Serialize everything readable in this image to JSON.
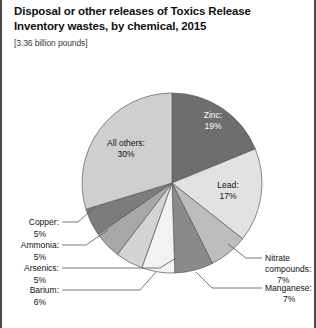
{
  "header": {
    "title": "Disposal or other releases of Toxics Release Inventory wastes, by chemical, 2015",
    "subtitle": "[3.36 billion pounds]"
  },
  "chart_data": {
    "type": "pie",
    "title": "Disposal or other releases of Toxics Release Inventory wastes, by chemical, 2015",
    "subtitle": "[3.36 billion pounds]",
    "unit": "percent of 3.36 billion pounds",
    "total_label": "3.36 billion pounds",
    "legend": "none",
    "grid": false,
    "categories": [
      "Zinc",
      "Lead",
      "Nitrate compounds",
      "Manganese",
      "Barium",
      "Arsenics",
      "Ammonia",
      "Copper",
      "All others"
    ],
    "values": [
      19,
      17,
      7,
      7,
      6,
      5,
      5,
      5,
      30
    ],
    "slices": [
      {
        "name": "Zinc",
        "label": "Zinc:",
        "value_label": "19%",
        "value": 19,
        "color": "#6e6e6e",
        "label_placement": "inside",
        "text_color": "#ffffff"
      },
      {
        "name": "Lead",
        "label": "Lead:",
        "value_label": "17%",
        "value": 17,
        "color": "#e2e2e2",
        "label_placement": "inside",
        "text_color": "#111111"
      },
      {
        "name": "Nitrate compounds",
        "label": "Nitrate compounds:",
        "value_label": "7%",
        "value": 7,
        "color": "#bdbdbd",
        "label_placement": "outside-right",
        "text_color": "#111111"
      },
      {
        "name": "Manganese",
        "label": "Manganese:",
        "value_label": "7%",
        "value": 7,
        "color": "#8a8a8a",
        "label_placement": "outside-right",
        "text_color": "#111111"
      },
      {
        "name": "Barium",
        "label": "Barium:",
        "value_label": "6%",
        "value": 6,
        "color": "#f2f2f2",
        "label_placement": "outside-left",
        "text_color": "#111111"
      },
      {
        "name": "Arsenics",
        "label": "Arsenics:",
        "value_label": "5%",
        "value": 5,
        "color": "#d4d4d4",
        "label_placement": "outside-left",
        "text_color": "#111111"
      },
      {
        "name": "Ammonia",
        "label": "Ammonia:",
        "value_label": "5%",
        "value": 5,
        "color": "#a8a8a8",
        "label_placement": "outside-left",
        "text_color": "#111111"
      },
      {
        "name": "Copper",
        "label": "Copper:",
        "value_label": "5%",
        "value": 5,
        "color": "#7c7c7c",
        "label_placement": "outside-left",
        "text_color": "#111111"
      },
      {
        "name": "All others",
        "label": "All others:",
        "value_label": "30%",
        "value": 30,
        "color": "#cfcfcf",
        "label_placement": "inside",
        "text_color": "#111111"
      }
    ]
  },
  "labels": {
    "zinc_name": "Zinc:",
    "zinc_pct": "19%",
    "lead_name": "Lead:",
    "lead_pct": "17%",
    "allothers_name": "All others:",
    "allothers_pct": "30%",
    "nitrate_l1": "Nitrate",
    "nitrate_l2": "compounds:",
    "nitrate_pct": "7%",
    "manganese_name": "Manganese:",
    "manganese_pct": "7%",
    "barium_name": "Barium:",
    "barium_pct": "6%",
    "arsenics_name": "Arsenics:",
    "arsenics_pct": "5%",
    "ammonia_name": "Ammonia:",
    "ammonia_pct": "5%",
    "copper_name": "Copper:",
    "copper_pct": "5%"
  }
}
